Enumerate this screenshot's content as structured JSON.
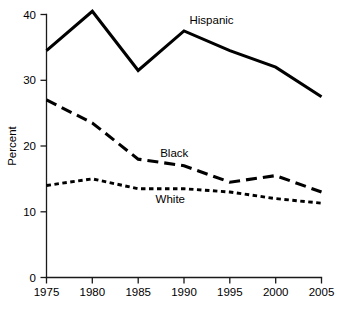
{
  "chart_data": {
    "type": "line",
    "title": "",
    "xlabel": "",
    "ylabel": "Percent",
    "x": [
      1975,
      1980,
      1985,
      1990,
      1995,
      2000,
      2005
    ],
    "xticklabels": [
      "1975",
      "1980",
      "1985",
      "1990",
      "1995",
      "2000",
      "2005"
    ],
    "yticklabels": [
      "0",
      "10",
      "20",
      "30",
      "40"
    ],
    "yticks": [
      0,
      10,
      20,
      30,
      40
    ],
    "xlim": [
      1975,
      2005
    ],
    "ylim": [
      0,
      40
    ],
    "grid": false,
    "legend_position": "inline-annotations",
    "series": [
      {
        "name": "Hispanic",
        "style": "solid",
        "values": [
          34.5,
          40.5,
          31.5,
          37.5,
          34.5,
          32.0,
          27.5
        ],
        "label": "Hispanic",
        "label_x": 1990.6,
        "label_y": 38.6
      },
      {
        "name": "Black",
        "style": "long-dash",
        "values": [
          27.0,
          23.5,
          18.0,
          17.0,
          14.5,
          15.5,
          13.0
        ],
        "label": "Black",
        "label_x": 1987.4,
        "label_y": 18.4
      },
      {
        "name": "White",
        "style": "short-dash",
        "values": [
          14.0,
          15.0,
          13.5,
          13.5,
          13.0,
          12.0,
          11.3
        ],
        "label": "White",
        "label_x": 1986.9,
        "label_y": 11.3
      }
    ]
  },
  "axis": {
    "y_title": "Percent"
  }
}
